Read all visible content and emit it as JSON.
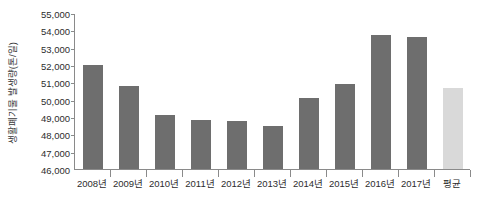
{
  "chart_data": {
    "type": "bar",
    "title": "",
    "xlabel": "",
    "ylabel": "생활폐기물 발생량(톤/일)",
    "ylim": [
      46000,
      55000
    ],
    "ytick_step": 1000,
    "ytick_labels": [
      "55,000",
      "54,000",
      "53,000",
      "52,000",
      "51,000",
      "50,000",
      "49,000",
      "48,000",
      "47,000",
      "46,000"
    ],
    "ytick_values": [
      55000,
      54000,
      53000,
      52000,
      51000,
      50000,
      49000,
      48000,
      47000,
      46000
    ],
    "grid": false,
    "legend": "none",
    "categories": [
      "2008년",
      "2009년",
      "2010년",
      "2011년",
      "2012년",
      "2013년",
      "2014년",
      "2015년",
      "2016년",
      "2017년",
      "평균"
    ],
    "values": [
      52000,
      50800,
      49100,
      48800,
      48750,
      48500,
      50100,
      50900,
      53750,
      53600,
      50700
    ],
    "bar_colors": [
      "#6e6e6e",
      "#6e6e6e",
      "#6e6e6e",
      "#6e6e6e",
      "#6e6e6e",
      "#6e6e6e",
      "#6e6e6e",
      "#6e6e6e",
      "#6e6e6e",
      "#6e6e6e",
      "#d9d9d9"
    ],
    "series": [
      {
        "name": "생활폐기물 발생량(톤/일)",
        "values": [
          52000,
          50800,
          49100,
          48800,
          48750,
          48500,
          50100,
          50900,
          53750,
          53600,
          50700
        ]
      }
    ],
    "accent_color": "#6e6e6e",
    "average_color": "#d9d9d9",
    "axis_color": "#8a8a8a",
    "text_color": "#2d2d2d"
  }
}
